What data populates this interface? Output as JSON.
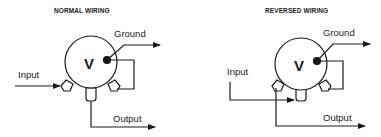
{
  "diagrams": [
    {
      "title": "NORMAL WIRING",
      "center_label": "V",
      "labels": {
        "ground": "Ground",
        "input": "Input",
        "output": "Output"
      }
    },
    {
      "title": "REVERSED WIRING",
      "center_label": "V",
      "labels": {
        "ground": "Ground",
        "input": "Input",
        "output": "Output"
      }
    }
  ],
  "colors": {
    "stroke": "#1a1a1a",
    "fill": "#ffffff",
    "background": "#ffffff"
  }
}
